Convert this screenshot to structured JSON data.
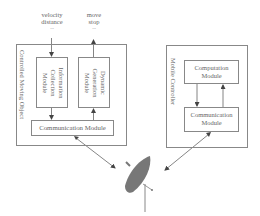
{
  "inputs": {
    "left_label_line1": "velocity",
    "left_label_line2": "distance",
    "right_label_line1": "move",
    "right_label_line2": "stop",
    "ellipsis": "..."
  },
  "controlled_object": {
    "title": "Controlled Moving Object",
    "info_module": "Information Collection Module",
    "dyn_module": "Dynamic Generation Module",
    "comm_module": "Communication Module"
  },
  "mobile_controller": {
    "title": "Mobile Controller",
    "computation_line1": "Computation",
    "computation_line2": "Module",
    "comm_line1": "Communication",
    "comm_line2": "Module"
  },
  "satellite": {
    "icon": "satellite-dish-icon"
  },
  "colors": {
    "line": "#888888",
    "dish": "#777777",
    "text": "#666666"
  }
}
